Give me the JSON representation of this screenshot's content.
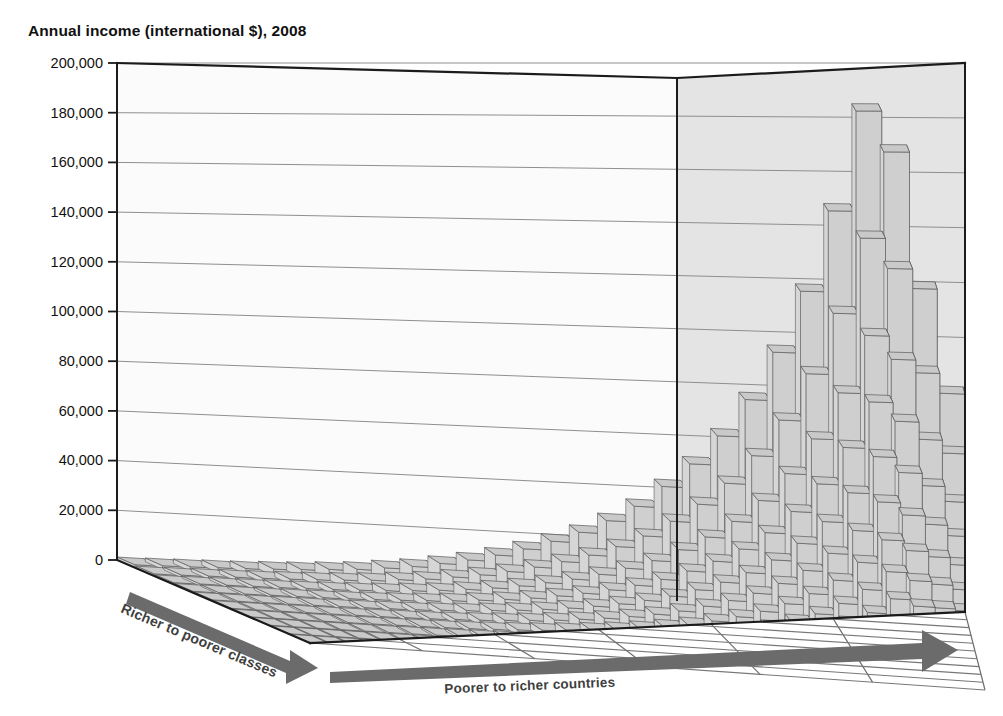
{
  "chart_data": {
    "type": "bar",
    "title": "Annual income (international $), 2008",
    "subtitle": "",
    "projection": "3d-surface-bars",
    "xlabel": "Poorer to richer countries",
    "zlabel": "Richer to poorer classes",
    "ylabel": "Annual income (international $)",
    "ylim": [
      0,
      200000
    ],
    "ytick_step": 20000,
    "yticks": [
      "200,000",
      "180,000",
      "160,000",
      "140,000",
      "120,000",
      "100,000",
      "80,000",
      "60,000",
      "40,000",
      "20,000",
      "0"
    ],
    "ytick_values": [
      200000,
      180000,
      160000,
      140000,
      120000,
      100000,
      80000,
      60000,
      40000,
      20000,
      0
    ],
    "grid": true,
    "legend": "none",
    "x_categories_count": 30,
    "z_categories_count": 10,
    "x_axis_note": "Countries ordered poorest (left/back) to richest (right/front-right)",
    "z_axis_note": "Income classes ordered richest (front-left) to poorest (back-right)",
    "series": [
      {
        "name": "class-1-richest",
        "values": [
          1200,
          1500,
          1800,
          2100,
          2400,
          2900,
          3400,
          4100,
          4800,
          6000,
          7200,
          9000,
          11000,
          13500,
          16500,
          20000,
          24000,
          29000,
          35000,
          43000,
          52000,
          63000,
          77000,
          95000,
          118000,
          148000,
          185000,
          170000,
          120000,
          82000
        ]
      },
      {
        "name": "class-2",
        "values": [
          900,
          1100,
          1350,
          1600,
          1850,
          2200,
          2600,
          3100,
          3700,
          4600,
          5500,
          6900,
          8400,
          10300,
          12600,
          15300,
          18400,
          22200,
          26800,
          32900,
          39800,
          48200,
          59000,
          72700,
          90300,
          113000,
          141000,
          130000,
          92000,
          63000
        ]
      },
      {
        "name": "class-3",
        "values": [
          700,
          850,
          1050,
          1250,
          1450,
          1700,
          2000,
          2400,
          2850,
          3500,
          4250,
          5300,
          6450,
          7900,
          9700,
          11700,
          14100,
          17000,
          20500,
          25200,
          30500,
          36900,
          45200,
          55700,
          69100,
          86500,
          108000,
          99500,
          70500,
          48200
        ]
      },
      {
        "name": "class-4",
        "values": [
          560,
          680,
          840,
          1000,
          1160,
          1360,
          1600,
          1920,
          2280,
          2800,
          3400,
          4240,
          5160,
          6320,
          7760,
          9360,
          11280,
          13600,
          16400,
          20160,
          24400,
          29520,
          36160,
          44560,
          55280,
          69200,
          86400,
          79600,
          56400,
          38560
        ]
      },
      {
        "name": "class-5",
        "values": [
          450,
          540,
          670,
          800,
          930,
          1090,
          1280,
          1540,
          1820,
          2240,
          2720,
          3390,
          4130,
          5060,
          6210,
          7490,
          9020,
          10880,
          13120,
          16130,
          19520,
          23620,
          28930,
          35650,
          44220,
          55360,
          69120,
          63680,
          45120,
          30850
        ]
      },
      {
        "name": "class-6",
        "values": [
          360,
          430,
          540,
          640,
          740,
          870,
          1020,
          1230,
          1460,
          1790,
          2180,
          2710,
          3300,
          4050,
          4970,
          5990,
          7220,
          8700,
          10500,
          12900,
          15620,
          18900,
          23140,
          28520,
          35380,
          44290,
          55300,
          50940,
          36100,
          24680
        ]
      },
      {
        "name": "class-7",
        "values": [
          290,
          345,
          430,
          510,
          595,
          700,
          820,
          985,
          1170,
          1430,
          1740,
          2170,
          2640,
          3240,
          3970,
          4790,
          5770,
          6960,
          8400,
          10320,
          12500,
          15120,
          18510,
          22820,
          28300,
          35430,
          44240,
          40750,
          28880,
          19740
        ]
      },
      {
        "name": "class-8",
        "values": [
          230,
          275,
          345,
          410,
          475,
          560,
          655,
          790,
          935,
          1145,
          1395,
          1735,
          2115,
          2590,
          3180,
          3830,
          4620,
          5570,
          6720,
          8260,
          10000,
          12100,
          14810,
          18250,
          22640,
          28340,
          35390,
          32600,
          23100,
          15790
        ]
      },
      {
        "name": "class-9",
        "values": [
          185,
          220,
          275,
          330,
          380,
          445,
          525,
          630,
          750,
          915,
          1115,
          1390,
          1690,
          2070,
          2540,
          3060,
          3690,
          4450,
          5370,
          6600,
          8000,
          9680,
          11850,
          14600,
          18110,
          22670,
          28310,
          26080,
          18480,
          12630
        ]
      },
      {
        "name": "class-10-poorest",
        "values": [
          145,
          175,
          220,
          260,
          305,
          355,
          420,
          505,
          600,
          735,
          890,
          1110,
          1355,
          1660,
          2035,
          2450,
          2955,
          3560,
          4300,
          5280,
          6400,
          7740,
          9480,
          11680,
          14490,
          18140,
          22650,
          20860,
          14780,
          10100
        ]
      }
    ],
    "annotations": [
      {
        "text": "Tallest column ≈ 185,000 international $ (richest class of the richest country)"
      },
      {
        "text": "Secondary peak ≈ 170,000"
      },
      {
        "text": "Left / back region flat, below ~30,000"
      }
    ]
  },
  "axes": {
    "y_caption": "Annual income (international $), 2008",
    "bottom_right_arrow_label": "Poorer to richer countries",
    "bottom_left_arrow_label": "Richer to poorer classes"
  },
  "colors": {
    "bar_top_face": "#c9c9c9",
    "bar_front_face": "#cfcfcf",
    "bar_side_face": "#4a4a4a",
    "back_wall_left": "#fbfbfb",
    "back_wall_right": "#e4e4e4",
    "floor": "#8d8d8d",
    "grid_line": "#7b7b7b",
    "axis_line": "#1b1b1b",
    "arrow": "#6b6b6b",
    "text": "#111111"
  },
  "icons": {
    "right_arrow": "right-arrow-icon",
    "down_right_arrow": "down-right-arrow-icon"
  }
}
